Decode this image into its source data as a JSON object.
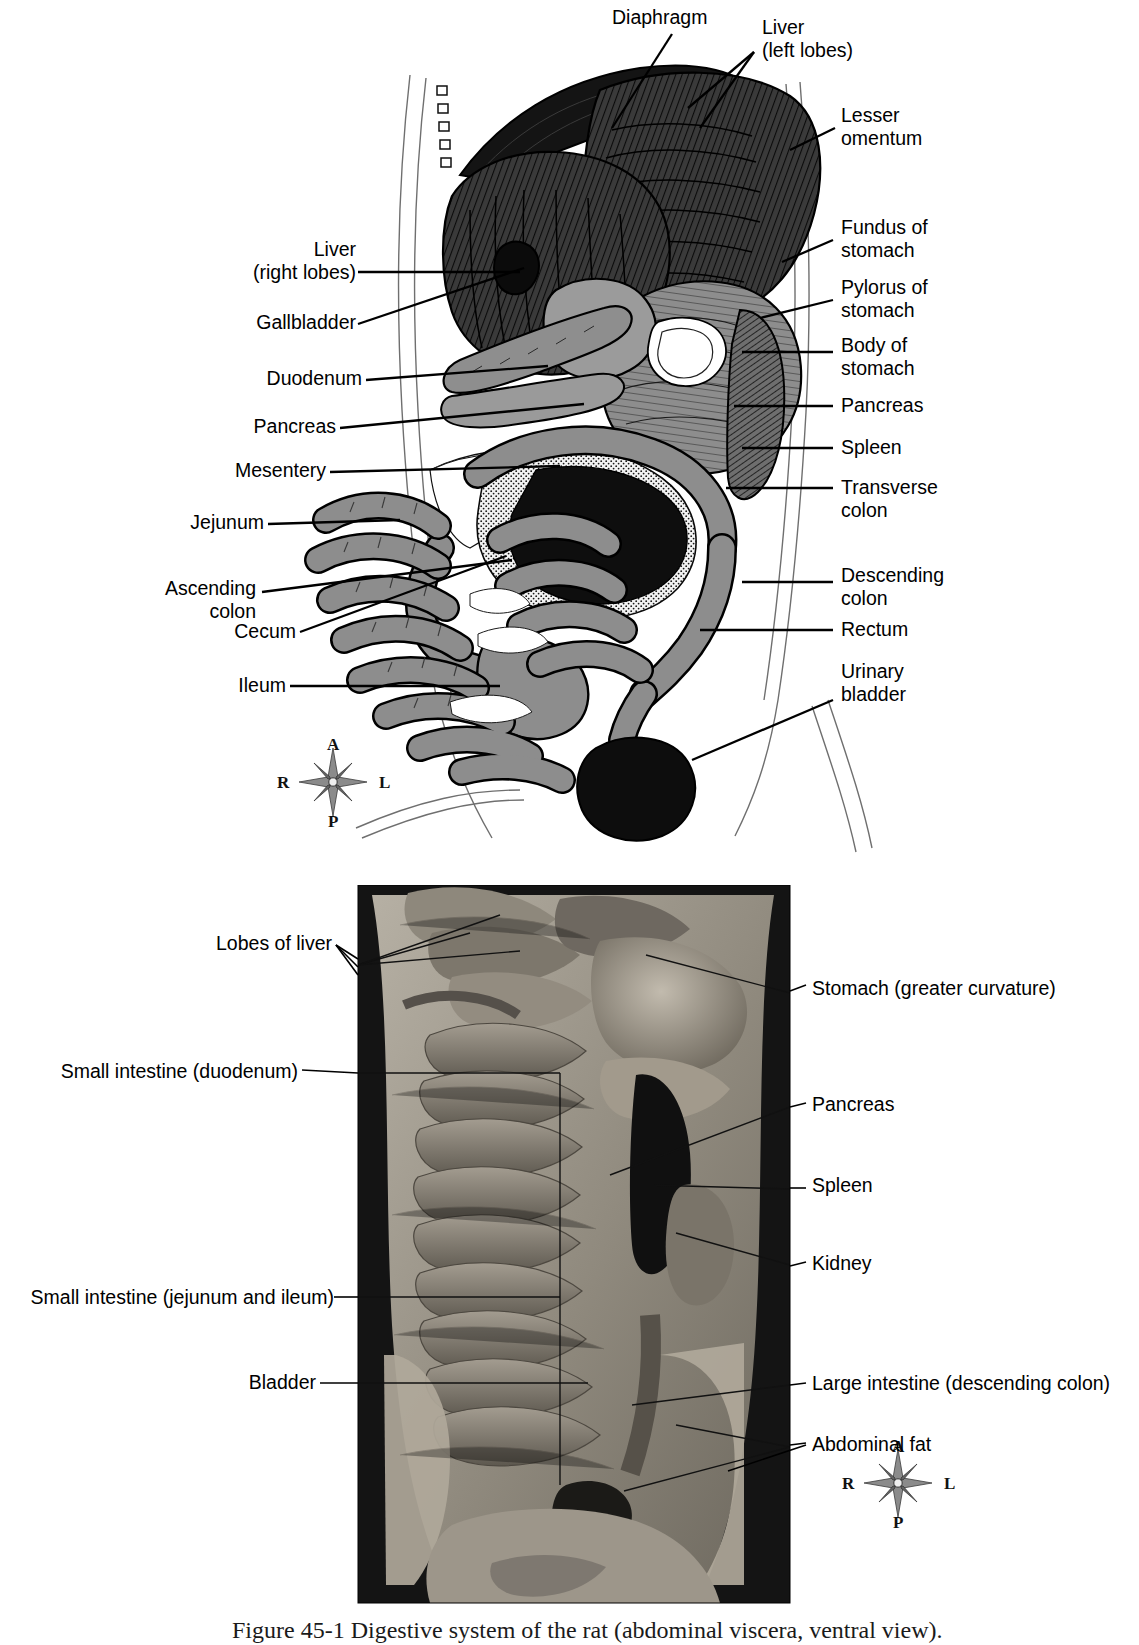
{
  "figure": {
    "caption_number": "Figure 45-1",
    "caption_text": "Digestive system of the rat (abdominal viscera, ventral view)."
  },
  "panel_a": {
    "name": "illustration-abdominal-viscera-diagram",
    "labels_left": [
      {
        "id": "liver-right-lobes",
        "text": "Liver\n(right lobes)"
      },
      {
        "id": "gallbladder",
        "text": "Gallbladder"
      },
      {
        "id": "duodenum",
        "text": "Duodenum"
      },
      {
        "id": "pancreas",
        "text": "Pancreas"
      },
      {
        "id": "mesentery",
        "text": "Mesentery"
      },
      {
        "id": "jejunum",
        "text": "Jejunum"
      },
      {
        "id": "ascending-colon",
        "text": "Ascending\ncolon"
      },
      {
        "id": "cecum",
        "text": "Cecum"
      },
      {
        "id": "ileum",
        "text": "Ileum"
      }
    ],
    "labels_top": [
      {
        "id": "diaphragm",
        "text": "Diaphragm"
      },
      {
        "id": "liver-left-lobes",
        "text": "Liver\n(left lobes)"
      }
    ],
    "labels_right": [
      {
        "id": "lesser-omentum",
        "text": "Lesser\nomentum"
      },
      {
        "id": "fundus-of-stomach",
        "text": "Fundus of\nstomach"
      },
      {
        "id": "pylorus-of-stomach",
        "text": "Pylorus of\nstomach"
      },
      {
        "id": "body-of-stomach",
        "text": "Body of\nstomach"
      },
      {
        "id": "pancreas",
        "text": "Pancreas"
      },
      {
        "id": "spleen",
        "text": "Spleen"
      },
      {
        "id": "transverse-colon",
        "text": "Transverse\ncolon"
      },
      {
        "id": "descending-colon",
        "text": "Descending\ncolon"
      },
      {
        "id": "rectum",
        "text": "Rectum"
      },
      {
        "id": "urinary-bladder",
        "text": "Urinary\nbladder"
      }
    ],
    "compass": {
      "anterior": "A",
      "left": "L",
      "right": "R",
      "posterior": "P"
    }
  },
  "panel_b": {
    "name": "photograph-abdominal-viscera",
    "labels_left": [
      {
        "id": "lobes-of-liver",
        "text": "Lobes of liver"
      },
      {
        "id": "small-intestine-duodenum",
        "text": "Small intestine (duodenum)"
      },
      {
        "id": "small-intestine-jejunum-ileum",
        "text": "Small intestine (jejunum and ileum)"
      },
      {
        "id": "bladder",
        "text": "Bladder"
      }
    ],
    "labels_right": [
      {
        "id": "stomach-greater-curvature",
        "text": "Stomach (greater curvature)"
      },
      {
        "id": "pancreas",
        "text": "Pancreas"
      },
      {
        "id": "spleen",
        "text": "Spleen"
      },
      {
        "id": "kidney",
        "text": "Kidney"
      },
      {
        "id": "large-intestine-descending-colon",
        "text": "Large intestine (descending colon)"
      },
      {
        "id": "abdominal-fat",
        "text": "Abdominal fat"
      }
    ],
    "compass": {
      "anterior": "A",
      "left": "L",
      "right": "R",
      "posterior": "P"
    }
  },
  "colors": {
    "ink": "#000000",
    "organ_mid": "#8a8a8a",
    "organ_dark": "#2b2b2b",
    "organ_light": "#bdbdbd",
    "photo_dark": "#151515",
    "photo_tissue": "#9a9489"
  }
}
